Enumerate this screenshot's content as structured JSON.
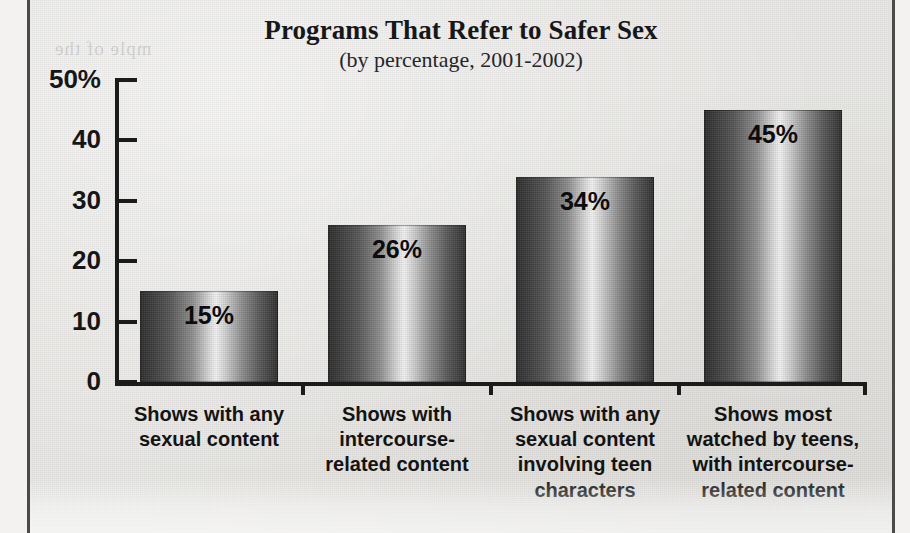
{
  "chart_data": {
    "type": "bar",
    "title": "Programs That Refer to Safer Sex",
    "subtitle": "(by percentage, 2001-2002)",
    "xlabel": "",
    "ylabel": "",
    "ylim": [
      0,
      50
    ],
    "grid": false,
    "legend": null,
    "y_ticks": [
      {
        "value": 50,
        "label": "50%"
      },
      {
        "value": 40,
        "label": "40"
      },
      {
        "value": 30,
        "label": "30"
      },
      {
        "value": 20,
        "label": "20"
      },
      {
        "value": 10,
        "label": "10"
      },
      {
        "value": 0,
        "label": "0"
      }
    ],
    "categories": [
      "Shows with any sexual content",
      "Shows with intercourse-related content",
      "Shows with any sexual content involving teen characters",
      "Shows most watched by teens, with intercourse-related content"
    ],
    "category_lines": [
      [
        "Shows with any",
        "sexual content"
      ],
      [
        "Shows with",
        "intercourse-",
        "related content"
      ],
      [
        "Shows with any",
        "sexual content",
        "involving teen",
        "characters"
      ],
      [
        "Shows most",
        "watched by teens,",
        "with intercourse-",
        "related content"
      ]
    ],
    "values": [
      15,
      26,
      34,
      45
    ],
    "value_labels": [
      "15%",
      "26%",
      "34%",
      "45%"
    ],
    "bar_style": "vertical-gradient-cylinder",
    "colors": {
      "bar_dark": "#2c2c2c",
      "bar_highlight": "#f2f2f2",
      "axis": "#1b1b1b",
      "text": "#131313",
      "background": "#e7e6e3",
      "frame_rule": "#4a4a48"
    }
  },
  "scan": {
    "ghost_text": "mple of the"
  }
}
